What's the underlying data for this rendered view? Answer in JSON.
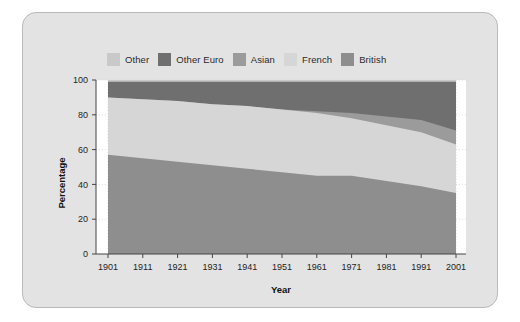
{
  "figure": {
    "panel_bg": "#e3e3e3",
    "plot_bg": "#ffffff"
  },
  "legend": {
    "position": "top-center",
    "entries": [
      {
        "label": "Other",
        "color": "#c9c9c9",
        "key": "other"
      },
      {
        "label": "Other Euro",
        "color": "#6f6f6f",
        "key": "other_euro"
      },
      {
        "label": "Asian",
        "color": "#9b9b9b",
        "key": "asian"
      },
      {
        "label": "French",
        "color": "#d6d6d6",
        "key": "french"
      },
      {
        "label": "British",
        "color": "#8e8e8e",
        "key": "british"
      }
    ]
  },
  "chart_data": {
    "type": "area",
    "stacked": true,
    "title": "",
    "xlabel": "Year",
    "ylabel": "Percentage",
    "xlim": [
      1901,
      2001
    ],
    "ylim": [
      0,
      100
    ],
    "grid": true,
    "x": [
      1901,
      1911,
      1921,
      1931,
      1941,
      1951,
      1961,
      1971,
      1981,
      1991,
      2001
    ],
    "xticklabels": [
      "1901",
      "1911",
      "1921",
      "1931",
      "1941",
      "1951",
      "1961",
      "1971",
      "1981",
      "1991",
      "2001"
    ],
    "yticks": [
      0,
      20,
      40,
      60,
      80,
      100
    ],
    "yticklabels": [
      "0",
      "20",
      "40",
      "60",
      "80",
      "100"
    ],
    "legend_position": "top-center",
    "series": [
      {
        "name": "British",
        "color": "#8e8e8e",
        "values": [
          57,
          55,
          53,
          51,
          49,
          47,
          45,
          45,
          42,
          39,
          35
        ]
      },
      {
        "name": "French",
        "color": "#d6d6d6",
        "values": [
          33,
          34,
          35,
          35,
          36,
          36,
          36,
          33,
          32,
          31,
          28
        ]
      },
      {
        "name": "Asian",
        "color": "#9b9b9b",
        "values": [
          0,
          0,
          0,
          0,
          0,
          0,
          1,
          3,
          5,
          7,
          8
        ]
      },
      {
        "name": "Other Euro",
        "color": "#6f6f6f",
        "values": [
          9,
          10,
          11,
          13,
          14,
          16,
          17,
          18,
          20,
          22,
          28
        ]
      },
      {
        "name": "Other",
        "color": "#c9c9c9",
        "values": [
          1,
          1,
          1,
          1,
          1,
          1,
          1,
          1,
          1,
          1,
          1
        ]
      }
    ],
    "cumulative_tops": {
      "British": [
        57,
        55,
        53,
        51,
        49,
        47,
        45,
        45,
        42,
        39,
        35
      ],
      "French": [
        90,
        89,
        88,
        86,
        85,
        83,
        81,
        78,
        74,
        70,
        63
      ],
      "Asian": [
        90,
        89,
        88,
        86,
        85,
        83,
        82,
        81,
        79,
        77,
        71
      ],
      "Other Euro": [
        99,
        99,
        99,
        99,
        99,
        99,
        99,
        99,
        99,
        99,
        99
      ],
      "Other": [
        100,
        100,
        100,
        100,
        100,
        100,
        100,
        100,
        100,
        100,
        100
      ]
    }
  }
}
